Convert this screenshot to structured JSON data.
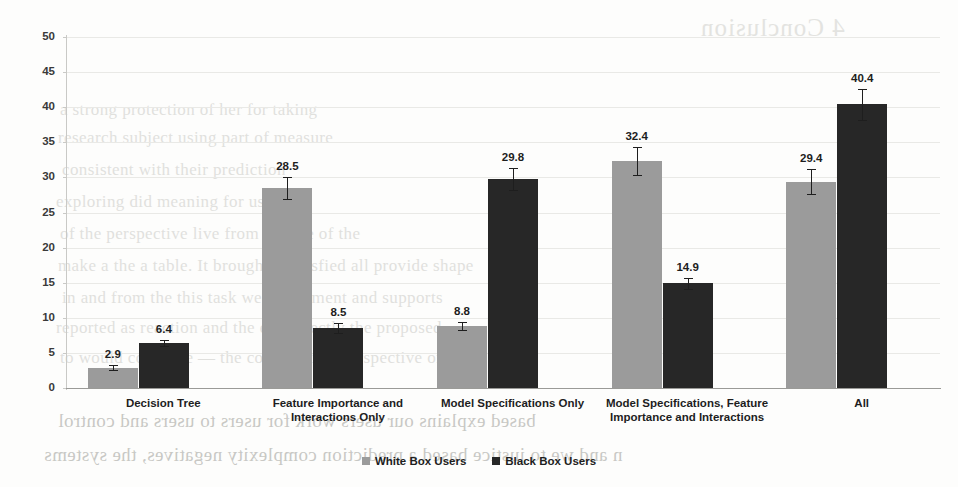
{
  "chart_data": {
    "type": "bar",
    "title": "",
    "xlabel": "",
    "ylabel": "",
    "ylim": [
      0,
      50
    ],
    "ytick_step": 5,
    "yticks": [
      50,
      45,
      40,
      35,
      30,
      25,
      20,
      15,
      10,
      5,
      0
    ],
    "grid": true,
    "legend_position": "bottom",
    "categories": [
      "Decision Tree",
      "Feature Importance and Interactions Only",
      "Model Specifications Only",
      "Model Specifications, Feature Importance and Interactions",
      "All"
    ],
    "category_lines": [
      [
        "Decision Tree"
      ],
      [
        "Feature Importance and",
        "Interactions Only"
      ],
      [
        "Model Specifications Only"
      ],
      [
        "Model Specifications, Feature",
        "Importance and Interactions"
      ],
      [
        "All"
      ]
    ],
    "series": [
      {
        "name": "White Box Users",
        "color": "#9b9b9b",
        "values": [
          2.9,
          28.5,
          8.8,
          32.4,
          29.4
        ],
        "labels": [
          "2.9",
          "28.5",
          "8.8",
          "32.4",
          "29.4"
        ],
        "errors": [
          0.4,
          1.6,
          0.6,
          2.0,
          1.8
        ]
      },
      {
        "name": "Black Box Users",
        "color": "#272727",
        "values": [
          6.4,
          8.5,
          29.8,
          14.9,
          40.4
        ],
        "labels": [
          "6.4",
          "8.5",
          "29.8",
          "14.9",
          "40.4"
        ],
        "errors": [
          0.4,
          0.7,
          1.6,
          0.8,
          2.2
        ]
      }
    ]
  },
  "legend": {
    "items": [
      {
        "label": "White Box Users",
        "color": "#9b9b9b"
      },
      {
        "label": "Black Box Users",
        "color": "#272727"
      }
    ]
  },
  "background_page": {
    "note": "faint scanned-document bleed-through behind the chart",
    "heading": "4  Conclusion",
    "lines": [
      "a strong protection of her for taking",
      "research subject using part of measure",
      "consistent with their prediction",
      "exploring did meaning for users,",
      "of the perspective live from the use of the",
      "make a the a table. It brought a satisfied all provide shape",
      "in and from the this task we experiment and supports",
      "reported as reaction and the end directly the proposed",
      "to would complete — the combination perspective of to the",
      "based explains our users work for users to users and control",
      "n and we to justice based a prediction complexity negatives, the systems"
    ]
  }
}
